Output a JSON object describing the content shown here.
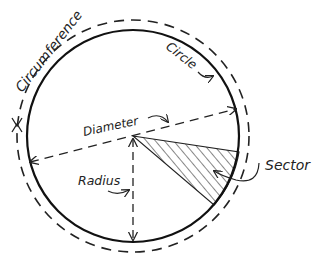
{
  "diagram": {
    "labels": {
      "circumference": "Circumference",
      "circle": "Circle",
      "diameter": "Diameter",
      "radius": "Radius",
      "sector": "Sector"
    },
    "colors": {
      "line": "#1a1a1a",
      "background": "#ffffff"
    }
  }
}
